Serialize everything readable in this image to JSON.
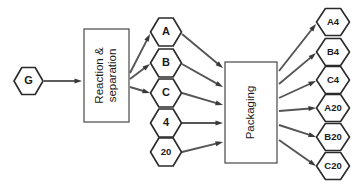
{
  "diagram": {
    "background_color": "#ffffff",
    "line_color": "#555555",
    "node_border_color": "#2b2b2b",
    "node_fill_color": "#ffffff",
    "text_color": "#1a1a1a"
  },
  "nodes": {
    "input": {
      "id": "G",
      "label": "G",
      "shape": "hexagon",
      "x": 28.5,
      "y": 81
    },
    "process_reaction": {
      "id": "reaction-separation",
      "label_line1": "Reaction &",
      "label_line2": "separation",
      "shape": "rectangle",
      "x": 84,
      "y": 29,
      "width": 45,
      "height": 93,
      "rotation": -90
    },
    "process_packaging": {
      "id": "packaging",
      "label": "Packaging",
      "shape": "rectangle",
      "x": 225,
      "y": 62,
      "width": 52,
      "height": 101,
      "rotation": -90
    }
  },
  "intermediates": [
    {
      "id": "A",
      "label": "A",
      "x": 166,
      "y": 32,
      "size": "normal"
    },
    {
      "id": "B",
      "label": "B",
      "x": 166,
      "y": 63,
      "size": "normal"
    },
    {
      "id": "C",
      "label": "C",
      "x": 166,
      "y": 93,
      "size": "normal"
    },
    {
      "id": "4",
      "label": "4",
      "x": 166,
      "y": 123,
      "size": "normal"
    },
    {
      "id": "20",
      "label": "20",
      "x": 166,
      "y": 152,
      "size": "small"
    }
  ],
  "products": [
    {
      "id": "A4",
      "label": "A4",
      "x": 333,
      "y": 22,
      "size": "small"
    },
    {
      "id": "B4",
      "label": "B4",
      "x": 333,
      "y": 52,
      "size": "small"
    },
    {
      "id": "C4",
      "label": "C4",
      "x": 333,
      "y": 80,
      "size": "small"
    },
    {
      "id": "A20",
      "label": "A20",
      "x": 333,
      "y": 108,
      "size": "small"
    },
    {
      "id": "B20",
      "label": "B20",
      "x": 333,
      "y": 137,
      "size": "small"
    },
    {
      "id": "C20",
      "label": "C20",
      "x": 333,
      "y": 166,
      "size": "small"
    }
  ],
  "edges": [
    {
      "id": "edge-g-reaction",
      "from": "G",
      "to": "reaction-separation",
      "x1": 44,
      "y1": 81,
      "x2": 82,
      "y2": 81
    },
    {
      "id": "edge-reaction-a",
      "from": "reaction-separation",
      "to": "A",
      "x1": 130,
      "y1": 73,
      "x2": 150,
      "y2": 34
    },
    {
      "id": "edge-reaction-b",
      "from": "reaction-separation",
      "to": "B",
      "x1": 130,
      "y1": 79,
      "x2": 150,
      "y2": 64
    },
    {
      "id": "edge-reaction-c",
      "from": "reaction-separation",
      "to": "C",
      "x1": 130,
      "y1": 87,
      "x2": 150,
      "y2": 93
    },
    {
      "id": "edge-a-packaging",
      "from": "A",
      "to": "packaging",
      "x1": 182,
      "y1": 34,
      "x2": 223,
      "y2": 68
    },
    {
      "id": "edge-b-packaging",
      "from": "B",
      "to": "packaging",
      "x1": 182,
      "y1": 64,
      "x2": 223,
      "y2": 87
    },
    {
      "id": "edge-c-packaging",
      "from": "C",
      "to": "packaging",
      "x1": 182,
      "y1": 93,
      "x2": 223,
      "y2": 105
    },
    {
      "id": "edge-4-packaging",
      "from": "4",
      "to": "packaging",
      "x1": 182,
      "y1": 123,
      "x2": 223,
      "y2": 123
    },
    {
      "id": "edge-20-packaging",
      "from": "20",
      "to": "packaging",
      "x1": 182,
      "y1": 152,
      "x2": 223,
      "y2": 142
    },
    {
      "id": "edge-packaging-a4",
      "from": "packaging",
      "to": "A4",
      "x1": 279,
      "y1": 71,
      "x2": 316,
      "y2": 24
    },
    {
      "id": "edge-packaging-b4",
      "from": "packaging",
      "to": "B4",
      "x1": 279,
      "y1": 84,
      "x2": 316,
      "y2": 53
    },
    {
      "id": "edge-packaging-c4",
      "from": "packaging",
      "to": "C4",
      "x1": 279,
      "y1": 98,
      "x2": 316,
      "y2": 81
    },
    {
      "id": "edge-packaging-a20",
      "from": "packaging",
      "to": "A20",
      "x1": 279,
      "y1": 111,
      "x2": 316,
      "y2": 108
    },
    {
      "id": "edge-packaging-b20",
      "from": "packaging",
      "to": "B20",
      "x1": 279,
      "y1": 125,
      "x2": 316,
      "y2": 137
    },
    {
      "id": "edge-packaging-c20",
      "from": "packaging",
      "to": "C20",
      "x1": 279,
      "y1": 140,
      "x2": 316,
      "y2": 166
    }
  ]
}
